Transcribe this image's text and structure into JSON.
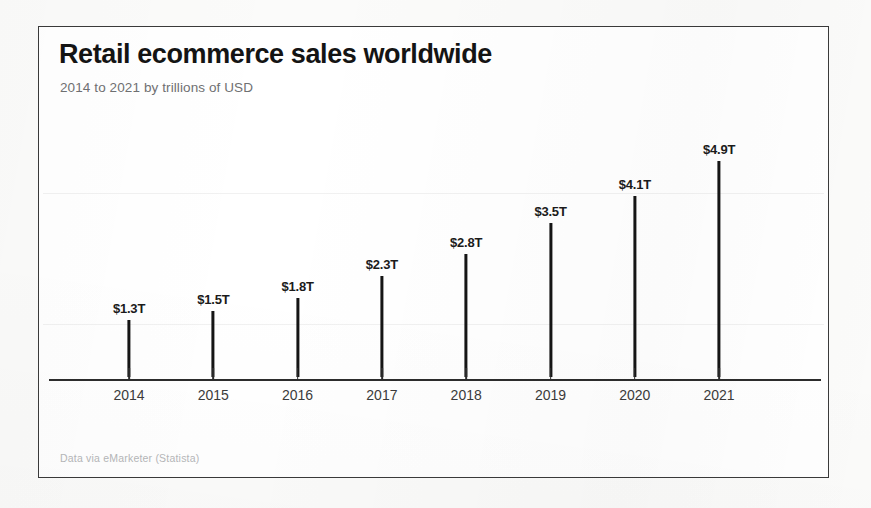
{
  "card": {
    "title": "Retail ecommerce sales worldwide",
    "subtitle": "2014 to 2021 by trillions of USD",
    "footer": "Data via eMarketer (Statista)",
    "border_color": "#3a3a3a",
    "background_color": "#ffffff"
  },
  "page": {
    "background_color": "#fbfbfa"
  },
  "chart_data": {
    "type": "bar",
    "title": "Retail ecommerce sales worldwide",
    "subtitle": "2014 to 2021 by trillions of USD",
    "xlabel": "",
    "ylabel": "trillions of USD",
    "categories": [
      "2014",
      "2015",
      "2016",
      "2017",
      "2018",
      "2019",
      "2020",
      "2021"
    ],
    "values": [
      1.3,
      1.5,
      1.8,
      2.3,
      2.8,
      3.5,
      4.1,
      4.9
    ],
    "value_labels": [
      "$1.3T",
      "$1.5T",
      "$1.8T",
      "$2.3T",
      "$2.8T",
      "$3.5T",
      "$4.1T",
      "$4.9T"
    ],
    "ylim": [
      0,
      4.9
    ],
    "grid": true,
    "gridlines": [
      1.5,
      4.5
    ],
    "legend": "none",
    "bar_color": "#151515",
    "axis_color": "#2c2c2c",
    "source": "Data via eMarketer (Statista)"
  }
}
